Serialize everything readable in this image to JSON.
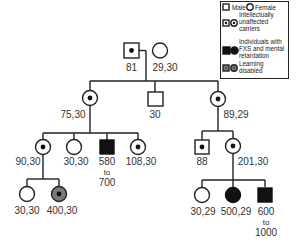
{
  "legend": {
    "male": "Male",
    "female": "Female",
    "carriers_l1": "Intellectually",
    "carriers_l2": "unaffected",
    "carriers_l3": "carriers",
    "fxs_l1": "Individuals with",
    "fxs_l2": "FXS and mental",
    "fxs_l3": "retardation",
    "ld_l1": "Learning",
    "ld_l2": "disabled"
  },
  "colors": {
    "line": "#222222",
    "affected": "#111111",
    "learning_disabled": "#7a7a7a"
  },
  "generation1": {
    "grandfather": {
      "sex": "male",
      "status": "carrier",
      "label": "81"
    },
    "grandmother": {
      "sex": "female",
      "status": "unaffected",
      "label": "29,30"
    }
  },
  "generation2": {
    "daughter_left": {
      "sex": "female",
      "status": "carrier",
      "label": "75,30"
    },
    "son": {
      "sex": "male",
      "status": "unaffected",
      "label": "30"
    },
    "daughter_right": {
      "sex": "female",
      "status": "carrier",
      "label": "89,29"
    }
  },
  "generation3": {
    "left_1": {
      "sex": "female",
      "status": "carrier",
      "label": "90,30"
    },
    "left_2": {
      "sex": "female",
      "status": "unaffected",
      "label": "30,30"
    },
    "left_3": {
      "sex": "male",
      "status": "affected",
      "label_l1": "580",
      "label_l2": "to",
      "label_l3": "700"
    },
    "left_4": {
      "sex": "female",
      "status": "carrier",
      "label": "108,30"
    },
    "right_1": {
      "sex": "male",
      "status": "carrier",
      "label": "88"
    },
    "right_2": {
      "sex": "female",
      "status": "carrier",
      "label": "201,30"
    }
  },
  "generation4": {
    "left_1": {
      "sex": "female",
      "status": "unaffected",
      "label": "30,30"
    },
    "left_2": {
      "sex": "female",
      "status": "learning-disabled carrier",
      "label": "400,30"
    },
    "right_1": {
      "sex": "female",
      "status": "unaffected",
      "label": "30,29"
    },
    "right_2": {
      "sex": "female",
      "status": "affected",
      "label": "500,29"
    },
    "right_3": {
      "sex": "male",
      "status": "affected",
      "label_l1": "600",
      "label_l2": "to",
      "label_l3": "1000"
    }
  }
}
